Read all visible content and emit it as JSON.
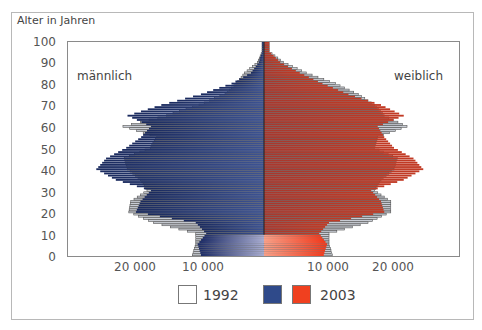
{
  "chart_data": {
    "type": "bar",
    "subtype": "population-pyramid",
    "title": "",
    "ylabel": "Alter in Jahren",
    "xlabel": "",
    "y_ticks": [
      "0",
      "10",
      "20",
      "30",
      "40",
      "50",
      "60",
      "70",
      "80",
      "90",
      "100"
    ],
    "x_ticks_left": [
      "20 000",
      "10 000"
    ],
    "x_ticks_right": [
      "10 000",
      "20 000"
    ],
    "xlim": [
      -30000,
      30000
    ],
    "ylim": [
      0,
      100
    ],
    "grid": false,
    "sex_labels": {
      "left": "männlich",
      "right": "weiblich"
    },
    "legend": [
      {
        "name": "1992",
        "style": "outline",
        "color": "#ffffff"
      },
      {
        "name": "2003 männlich",
        "color": "#2f4a8a"
      },
      {
        "name": "2003 weiblich",
        "color": "#f0401f",
        "label": "2003"
      }
    ],
    "categories": [
      "0",
      "5",
      "10",
      "15",
      "20",
      "25",
      "30",
      "35",
      "40",
      "45",
      "50",
      "55",
      "60",
      "65",
      "70",
      "75",
      "80",
      "85",
      "90",
      "95"
    ],
    "series": [
      {
        "name": "2003 männlich",
        "values": [
          9700,
          10200,
          8900,
          10500,
          19700,
          19000,
          17400,
          22800,
          25800,
          24300,
          21200,
          18900,
          17400,
          21000,
          15800,
          9700,
          5000,
          2000,
          800,
          300
        ]
      },
      {
        "name": "2003 weiblich",
        "values": [
          9200,
          9700,
          8500,
          10000,
          18500,
          18000,
          16500,
          21500,
          24500,
          23000,
          20000,
          18500,
          17500,
          21500,
          18000,
          13000,
          9000,
          5500,
          2500,
          800
        ]
      },
      {
        "name": "1992 männlich",
        "values": [
          11000,
          10500,
          10500,
          17000,
          20800,
          20500,
          18000,
          19000,
          21000,
          21500,
          17500,
          16500,
          21700,
          15000,
          10000,
          6000,
          4300,
          3000,
          1000,
          300
        ]
      },
      {
        "name": "1992 weiblich",
        "values": [
          10500,
          10000,
          10000,
          16000,
          19500,
          19500,
          17000,
          18000,
          20000,
          20500,
          17000,
          17500,
          22000,
          18500,
          17000,
          14500,
          11000,
          6500,
          3000,
          800
        ]
      }
    ]
  },
  "labels": {
    "y_title": "Alter in Jahren",
    "male": "männlich",
    "female": "weiblich",
    "legend_1992": "1992",
    "legend_2003": "2003",
    "ytick": [
      "100",
      "90",
      "80",
      "70",
      "60",
      "50",
      "40",
      "30",
      "20",
      "10",
      "0"
    ],
    "xtick": [
      "20 000",
      "10 000",
      "10 000",
      "20 000"
    ]
  }
}
